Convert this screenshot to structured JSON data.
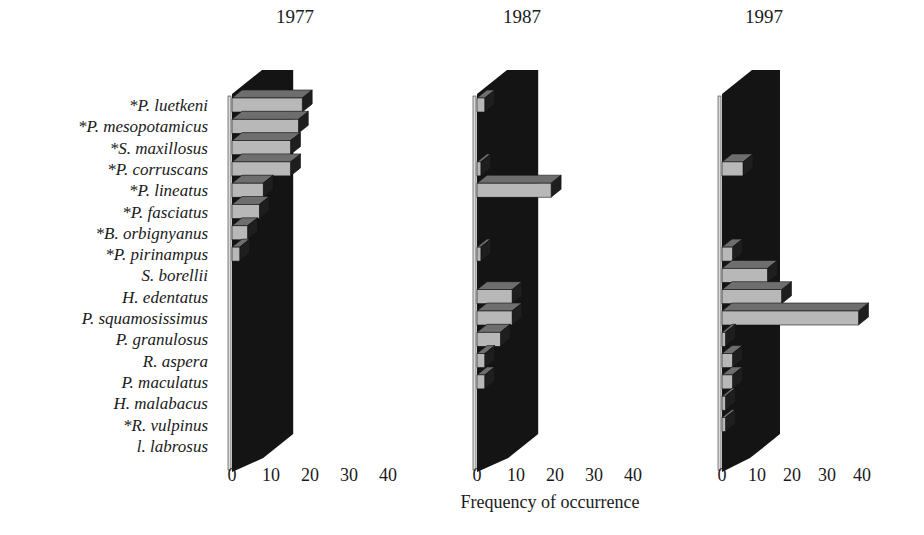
{
  "chart_data": {
    "type": "bar",
    "orientation": "horizontal",
    "style": "3d",
    "xlabel": "Frequency of occurrence",
    "ylabel": "",
    "xlim": [
      0,
      40
    ],
    "x_ticks": [
      "0",
      "10",
      "20",
      "30",
      "40"
    ],
    "grid": false,
    "legend": null,
    "note": "Asterisk (*) marks species names as shown on figure",
    "categories": [
      "*P. luetkeni",
      "*P. mesopotamicus",
      "*S. maxillosus",
      "*P. corruscans",
      "*P. lineatus",
      "*P. fasciatus",
      "*B. orbignyanus",
      "*P. pirinampus",
      "S. borellii",
      "H. edentatus",
      "P. squamosissimus",
      "P. granulosus",
      "R. aspera",
      "P. maculatus",
      "H. malabacus",
      "*R. vulpinus",
      "l. labrosus"
    ],
    "series": [
      {
        "name": "1977",
        "values": [
          18,
          17,
          15,
          15,
          8,
          7,
          4,
          2,
          0,
          0,
          0,
          0,
          0,
          0,
          0,
          0,
          0
        ]
      },
      {
        "name": "1987",
        "values": [
          2,
          0,
          0,
          1,
          19,
          0,
          0,
          1,
          0,
          9,
          9,
          6,
          2,
          2,
          0,
          0,
          0
        ]
      },
      {
        "name": "1997",
        "values": [
          0,
          0,
          0,
          6,
          0,
          0,
          0,
          3,
          13,
          17,
          39,
          1,
          3,
          3,
          1,
          1,
          0
        ]
      }
    ]
  },
  "panels": [
    {
      "title": "1977",
      "tick_labels": [
        "0",
        "10",
        "20",
        "30",
        "40"
      ]
    },
    {
      "title": "1987",
      "tick_labels": [
        "0",
        "10",
        "20",
        "30",
        "40"
      ]
    },
    {
      "title": "1997",
      "tick_labels": [
        "0",
        "10",
        "20",
        "30",
        "40"
      ]
    }
  ],
  "colors": {
    "bar_front": "#b8b8b8",
    "bar_top": "#6e6e6e",
    "bar_side": "#1e1e1e",
    "wall": "#141414",
    "axis": "#d9d9d9",
    "text": "#1a1a1a"
  }
}
